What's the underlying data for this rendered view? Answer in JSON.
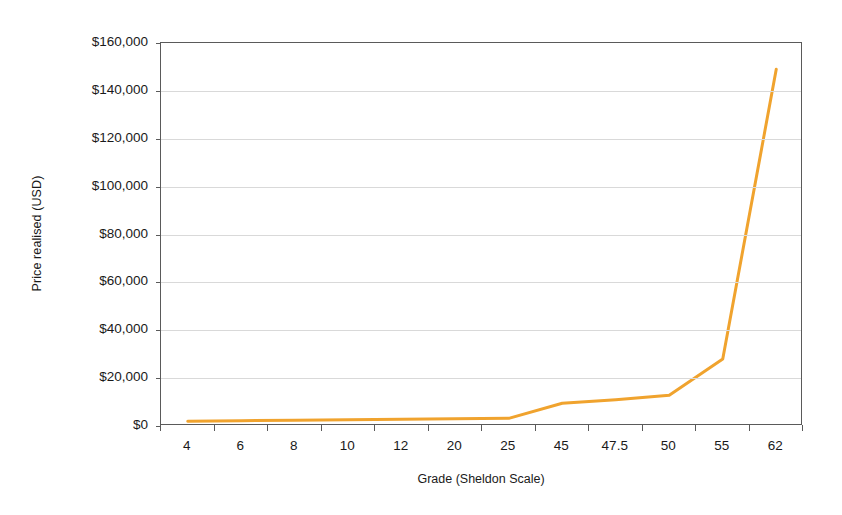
{
  "chart_data": {
    "type": "line",
    "title": "",
    "xlabel": "Grade (Sheldon Scale)",
    "ylabel": "Price realised (USD)",
    "categories": [
      "4",
      "6",
      "8",
      "10",
      "12",
      "20",
      "25",
      "45",
      "47.5",
      "50",
      "55",
      "62"
    ],
    "series": [
      {
        "name": "Price realised (USD)",
        "color": "#F0A32E",
        "values": [
          2000,
          2200,
          2400,
          2600,
          2800,
          3000,
          3200,
          9500,
          11000,
          12800,
          28000,
          149000
        ]
      }
    ],
    "ylim": [
      0,
      160000
    ],
    "ytick_values": [
      0,
      20000,
      40000,
      60000,
      80000,
      100000,
      120000,
      140000,
      160000
    ],
    "ytick_labels": [
      "$0",
      "$20,000",
      "$40,000",
      "$60,000",
      "$80,000",
      "$100,000",
      "$120,000",
      "$140,000",
      "$160,000"
    ],
    "grid": true,
    "grid_axis": "y",
    "legend": false,
    "legend_position": "none",
    "plot_border": true,
    "marker": "none",
    "line_width": 3
  },
  "style": {
    "line_color": "#F0A32E",
    "gridline_color": "#D9D9D9",
    "axis_color": "#5A5A5A",
    "background": "#FFFFFF",
    "text_color": "#1A1A1A"
  }
}
